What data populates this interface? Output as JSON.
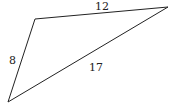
{
  "diagram": {
    "type": "triangle",
    "vertices": {
      "top_left": [
        35,
        19
      ],
      "top_right": [
        168,
        7
      ],
      "bottom_left": [
        8,
        102
      ]
    },
    "sides": [
      {
        "name": "top",
        "label": "12"
      },
      {
        "name": "left",
        "label": "8"
      },
      {
        "name": "diagonal",
        "label": "17"
      }
    ],
    "stroke_color": "#222222"
  }
}
